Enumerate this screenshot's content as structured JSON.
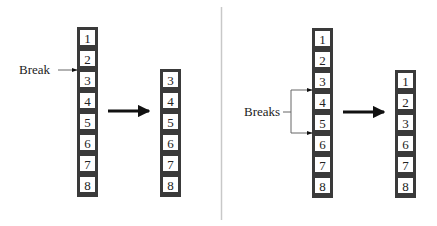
{
  "figure": {
    "left_panel": {
      "title": "single-break",
      "source_column": [
        "1",
        "2",
        "3",
        "4",
        "5",
        "6",
        "7",
        "8"
      ],
      "result_column": [
        "3",
        "4",
        "5",
        "6",
        "7",
        "8"
      ],
      "annotation": {
        "label": "Break",
        "between": [
          "2",
          "3"
        ]
      }
    },
    "right_panel": {
      "title": "double-break",
      "source_column": [
        "1",
        "2",
        "3",
        "4",
        "5",
        "6",
        "7",
        "8"
      ],
      "result_column": [
        "1",
        "2",
        "3",
        "6",
        "7",
        "8"
      ],
      "annotation": {
        "label": "Breaks",
        "between": [
          [
            "3",
            "4"
          ],
          [
            "5",
            "6"
          ]
        ]
      }
    },
    "colors": {
      "column_fill": "#3a3a3a",
      "cell_fill": "#ffffff",
      "text": "#222222",
      "arrow": "#111111",
      "leader_line": "#666666",
      "divider": "#c8c8c8"
    }
  }
}
